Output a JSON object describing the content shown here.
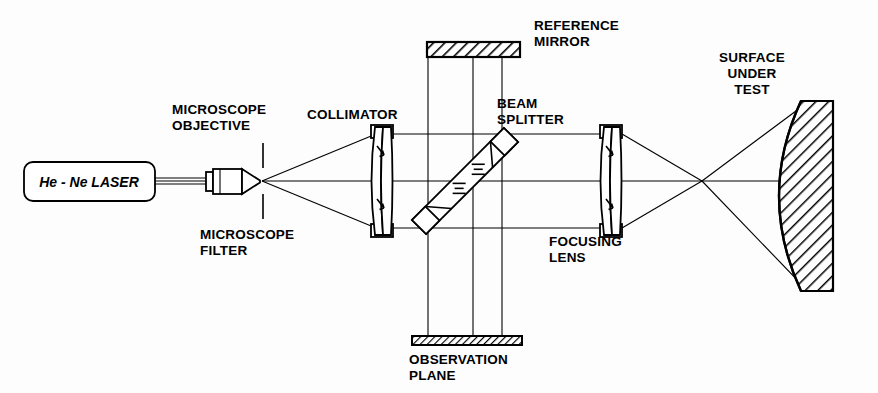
{
  "figure": {
    "background_color": "#fdfdfd",
    "line_color": "#000000"
  },
  "labels": {
    "laser": "He - Ne LASER",
    "microscope_objective_line1": "MICROSCOPE",
    "microscope_objective_line2": "OBJECTIVE",
    "microscope_filter_line1": "MICROSCOPE",
    "microscope_filter_line2": "FILTER",
    "collimator": "COLLIMATOR",
    "reference_mirror_line1": "REFERENCE",
    "reference_mirror_line2": "MIRROR",
    "beam_splitter_line1": "BEAM",
    "beam_splitter_line2": "SPLITTER",
    "observation_plane_line1": "OBSERVATION",
    "observation_plane_line2": "PLANE",
    "focusing_lens_line1": "FOCUSING",
    "focusing_lens_line2": "LENS",
    "surface_under_test_line1": "SURFACE",
    "surface_under_test_line2": "UNDER",
    "surface_under_test_line3": "TEST"
  },
  "components": [
    {
      "name": "he-ne-laser",
      "type": "source",
      "label": "He - Ne LASER"
    },
    {
      "name": "microscope-objective",
      "type": "lens-assembly",
      "label": "MICROSCOPE OBJECTIVE"
    },
    {
      "name": "microscope-filter",
      "type": "spatial-filter",
      "label": "MICROSCOPE FILTER"
    },
    {
      "name": "collimator",
      "type": "doublet-lens",
      "label": "COLLIMATOR"
    },
    {
      "name": "beam-splitter",
      "type": "plate-beamsplitter",
      "label": "BEAM SPLITTER"
    },
    {
      "name": "reference-mirror",
      "type": "flat-mirror",
      "label": "REFERENCE MIRROR"
    },
    {
      "name": "observation-plane",
      "type": "screen",
      "label": "OBSERVATION PLANE"
    },
    {
      "name": "focusing-lens",
      "type": "doublet-lens",
      "label": "FOCUSING LENS"
    },
    {
      "name": "surface-under-test",
      "type": "concave-mirror",
      "label": "SURFACE UNDER TEST"
    }
  ]
}
